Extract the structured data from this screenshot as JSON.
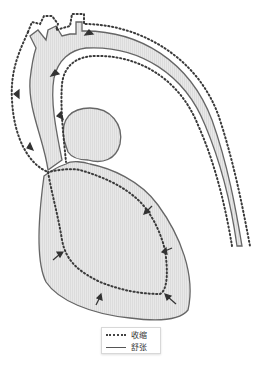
{
  "diagram": {
    "colors": {
      "tissue_fill": "#e4e4e4",
      "diastole_outline": "#666666",
      "systole_dots": "#3a3a3a",
      "arrow": "#333333"
    },
    "structures": [
      {
        "id": "aorta",
        "label": ""
      },
      {
        "id": "left-atrium",
        "label": ""
      },
      {
        "id": "left-ventricle",
        "label": ""
      },
      {
        "id": "aortic-arch-branches",
        "label": ""
      }
    ]
  },
  "legend": {
    "items": [
      {
        "style": "dotted",
        "label": "收缩"
      },
      {
        "style": "solid",
        "label": "舒张"
      }
    ]
  }
}
